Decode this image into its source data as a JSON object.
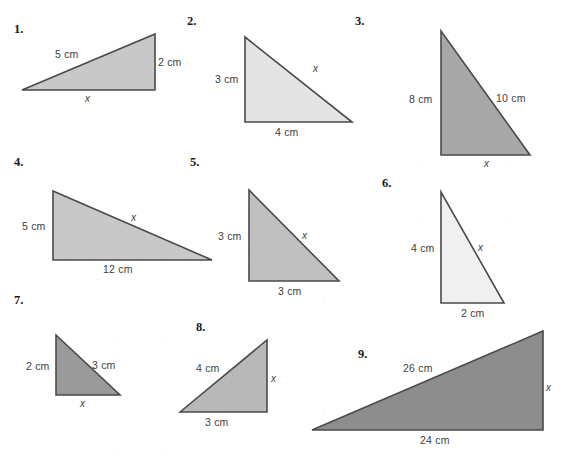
{
  "page": {
    "background_color": "#ffffff",
    "width": 564,
    "height": 462
  },
  "colors": {
    "stroke": "#4a4a4a",
    "label_text": "#3d3d3d",
    "number_text": "#1a1a1a",
    "fill_light": "#f0f0f0",
    "fill_pale": "#e4e4e4",
    "fill_mid_light": "#d4d4d4",
    "fill_mid": "#c8c8c8",
    "fill_medium": "#b8b8b8",
    "fill_dark": "#9a9a9a",
    "fill_darkest": "#8d8d8d"
  },
  "problems": [
    {
      "number": "1.",
      "fill": "#c8c8c8",
      "points": "22,90 155,34 155,90",
      "right_angle_corner": "bottom-right",
      "labels": [
        {
          "text": "5 cm",
          "role": "hypotenuse",
          "x": 55,
          "y": 48
        },
        {
          "text": "2 cm",
          "role": "vertical",
          "x": 158,
          "y": 56
        },
        {
          "text": "x",
          "role": "base",
          "italic": true,
          "x": 85,
          "y": 93
        }
      ]
    },
    {
      "number": "2.",
      "fill": "#e4e4e4",
      "points": "245,37 245,122 352,122",
      "right_angle_corner": "bottom-left",
      "labels": [
        {
          "text": "3 cm",
          "role": "vertical",
          "x": 215,
          "y": 73
        },
        {
          "text": "x",
          "role": "hypotenuse",
          "italic": true,
          "x": 313,
          "y": 63
        },
        {
          "text": "4 cm",
          "role": "base",
          "x": 275,
          "y": 126
        }
      ]
    },
    {
      "number": "3.",
      "fill": "#a8a8a8",
      "points": "441,31 441,155 530,155",
      "right_angle_corner": "bottom-left",
      "labels": [
        {
          "text": "8 cm",
          "role": "vertical",
          "x": 409,
          "y": 93
        },
        {
          "text": "10 cm",
          "role": "hypotenuse",
          "x": 496,
          "y": 92
        },
        {
          "text": "x",
          "role": "base",
          "italic": true,
          "x": 484,
          "y": 158
        }
      ]
    },
    {
      "number": "4.",
      "fill": "#c8c8c8",
      "points": "53,191 53,260 212,260",
      "right_angle_corner": "bottom-left",
      "labels": [
        {
          "text": "5 cm",
          "role": "vertical",
          "x": 22,
          "y": 220
        },
        {
          "text": "x",
          "role": "hypotenuse",
          "italic": true,
          "x": 131,
          "y": 212
        },
        {
          "text": "12 cm",
          "role": "base",
          "x": 103,
          "y": 263
        }
      ]
    },
    {
      "number": "5.",
      "fill": "#c0c0c0",
      "points": "249,190 249,281 339,281",
      "right_angle_corner": "bottom-left",
      "labels": [
        {
          "text": "3 cm",
          "role": "vertical",
          "x": 218,
          "y": 230
        },
        {
          "text": "x",
          "role": "hypotenuse",
          "italic": true,
          "x": 302,
          "y": 230
        },
        {
          "text": "3 cm",
          "role": "base",
          "x": 278,
          "y": 285
        }
      ]
    },
    {
      "number": "6.",
      "fill": "#f0f0f0",
      "points": "441,192 441,303 504,303",
      "right_angle_corner": "bottom-left",
      "labels": [
        {
          "text": "4 cm",
          "role": "vertical",
          "x": 411,
          "y": 242
        },
        {
          "text": "x",
          "role": "hypotenuse",
          "italic": true,
          "x": 478,
          "y": 242
        },
        {
          "text": "2 cm",
          "role": "base",
          "x": 461,
          "y": 307
        }
      ]
    },
    {
      "number": "7.",
      "fill": "#9a9a9a",
      "points": "56,335 56,395 120,395",
      "right_angle_corner": "bottom-left",
      "labels": [
        {
          "text": "2 cm",
          "role": "vertical",
          "x": 26,
          "y": 360
        },
        {
          "text": "3 cm",
          "role": "hypotenuse",
          "x": 92,
          "y": 359
        },
        {
          "text": "x",
          "role": "base",
          "italic": true,
          "x": 80,
          "y": 398
        }
      ]
    },
    {
      "number": "8.",
      "fill": "#b8b8b8",
      "points": "180,412 267,340 267,412",
      "right_angle_corner": "bottom-right",
      "labels": [
        {
          "text": "4 cm",
          "role": "hypotenuse",
          "x": 196,
          "y": 362
        },
        {
          "text": "x",
          "role": "vertical",
          "italic": true,
          "x": 271,
          "y": 373
        },
        {
          "text": "3 cm",
          "role": "base",
          "x": 205,
          "y": 416
        }
      ]
    },
    {
      "number": "9.",
      "fill": "#8d8d8d",
      "points": "312,430 543,331 543,430",
      "right_angle_corner": "bottom-right",
      "labels": [
        {
          "text": "26 cm",
          "role": "hypotenuse",
          "x": 403,
          "y": 362
        },
        {
          "text": "x",
          "role": "vertical",
          "italic": true,
          "x": 546,
          "y": 382
        },
        {
          "text": "24 cm",
          "role": "base",
          "x": 420,
          "y": 434
        }
      ]
    }
  ],
  "number_positions": [
    {
      "x": 14,
      "y": 22
    },
    {
      "x": 187,
      "y": 14
    },
    {
      "x": 355,
      "y": 14
    },
    {
      "x": 14,
      "y": 155
    },
    {
      "x": 190,
      "y": 155
    },
    {
      "x": 382,
      "y": 176
    },
    {
      "x": 14,
      "y": 293
    },
    {
      "x": 196,
      "y": 320
    },
    {
      "x": 358,
      "y": 347
    }
  ]
}
